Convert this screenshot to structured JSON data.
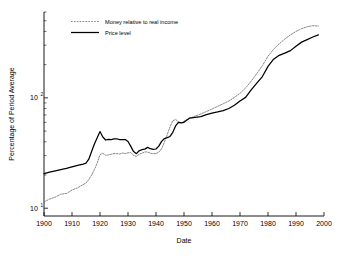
{
  "chart_data": {
    "type": "line",
    "title": "",
    "xlabel": "Date",
    "ylabel": "Percentage of Period Average",
    "xlim": [
      1900,
      2000
    ],
    "ylim": [
      8.5,
      600
    ],
    "yscale": "log",
    "xscale": "linear",
    "grid": false,
    "legend_position": "top-left-inside",
    "xticks": [
      1900,
      1910,
      1920,
      1930,
      1940,
      1950,
      1960,
      1970,
      1980,
      1990,
      2000
    ],
    "xticklabels": [
      "1900",
      "1910",
      "1920",
      "1930",
      "1940",
      "1950",
      "1960",
      "1970",
      "1980",
      "1990",
      "2000"
    ],
    "yticks": [
      10,
      100
    ],
    "yticklabels": [
      "10¹",
      "10²"
    ],
    "ytick_mantissa": [
      "10",
      "10"
    ],
    "ytick_exponent": [
      "1",
      "2"
    ],
    "series": [
      {
        "name": "Money relative to real income",
        "style": "dotted",
        "color": "#6f6f6f",
        "x": [
          1900,
          1902,
          1904,
          1906,
          1908,
          1910,
          1912,
          1914,
          1915,
          1916,
          1917,
          1918,
          1919,
          1920,
          1921,
          1922,
          1923,
          1924,
          1925,
          1926,
          1927,
          1928,
          1929,
          1930,
          1931,
          1932,
          1933,
          1934,
          1935,
          1936,
          1937,
          1938,
          1939,
          1940,
          1941,
          1942,
          1943,
          1944,
          1945,
          1946,
          1947,
          1948,
          1949,
          1950,
          1952,
          1954,
          1956,
          1958,
          1960,
          1962,
          1964,
          1966,
          1968,
          1970,
          1972,
          1974,
          1976,
          1978,
          1980,
          1982,
          1984,
          1986,
          1988,
          1990,
          1992,
          1994,
          1996,
          1998
        ],
        "y": [
          11.4,
          12.1,
          12.6,
          13.4,
          13.6,
          14.6,
          15.3,
          16.4,
          16.9,
          18.2,
          19.9,
          22.4,
          25.6,
          30.6,
          31.5,
          30.2,
          30.4,
          30.8,
          31.3,
          31.2,
          31.0,
          31.6,
          31.3,
          31.8,
          31.9,
          30.1,
          29.5,
          30.8,
          31.5,
          32.4,
          32.3,
          31.5,
          31.2,
          31.3,
          32.2,
          34.6,
          39.6,
          46.2,
          54.5,
          62.0,
          63.7,
          60.8,
          59.4,
          61.5,
          65.0,
          68.5,
          71.4,
          75.2,
          79.3,
          83.7,
          88.4,
          93.5,
          101.0,
          110.0,
          123.0,
          142.0,
          166.0,
          196.0,
          238.0,
          276.0,
          309.0,
          341.0,
          372.0,
          400.0,
          424.0,
          441.0,
          451.0,
          448.0
        ]
      },
      {
        "name": "Price level",
        "style": "solid",
        "color": "#000000",
        "x": [
          1900,
          1902,
          1904,
          1906,
          1908,
          1910,
          1912,
          1914,
          1915,
          1916,
          1917,
          1918,
          1919,
          1920,
          1921,
          1922,
          1923,
          1924,
          1925,
          1926,
          1927,
          1928,
          1929,
          1930,
          1931,
          1932,
          1933,
          1934,
          1935,
          1936,
          1937,
          1938,
          1939,
          1940,
          1941,
          1942,
          1943,
          1944,
          1945,
          1946,
          1947,
          1948,
          1949,
          1950,
          1952,
          1954,
          1956,
          1958,
          1960,
          1962,
          1964,
          1966,
          1968,
          1970,
          1972,
          1974,
          1976,
          1978,
          1980,
          1982,
          1984,
          1986,
          1988,
          1990,
          1992,
          1994,
          1996,
          1998
        ],
        "y": [
          20.6,
          21.2,
          21.8,
          22.4,
          23.0,
          23.7,
          24.4,
          25.1,
          25.6,
          27.8,
          32.7,
          38.2,
          43.5,
          49.5,
          44.2,
          41.5,
          42.0,
          41.9,
          42.4,
          42.6,
          41.9,
          41.8,
          41.9,
          40.2,
          36.3,
          32.6,
          31.2,
          33.2,
          34.0,
          34.3,
          35.6,
          34.6,
          34.1,
          34.4,
          36.5,
          40.3,
          42.8,
          43.6,
          44.7,
          48.7,
          55.7,
          59.9,
          59.3,
          60.1,
          65.6,
          66.7,
          67.6,
          70.6,
          72.6,
          74.5,
          76.7,
          80.1,
          85.6,
          93.6,
          101.0,
          118.0,
          136.0,
          156.0,
          193.0,
          224.0,
          243.0,
          254.0,
          268.0,
          294.0,
          320.0,
          337.0,
          356.0,
          372.0
        ]
      }
    ]
  },
  "legend": {
    "entries": [
      {
        "label": "Money relative to real income",
        "style": "dotted"
      },
      {
        "label": "Price level",
        "style": "solid"
      }
    ]
  },
  "axes": {
    "x_title": "Date",
    "y_title": "Percentage of Period Average"
  }
}
